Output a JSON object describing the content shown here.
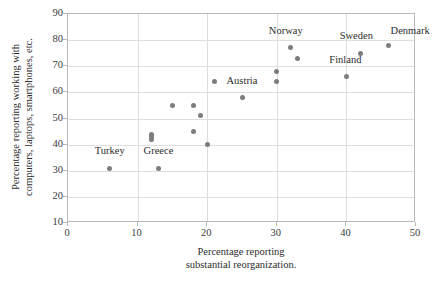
{
  "chart_data": {
    "type": "scatter",
    "title": "",
    "xlabel": "Percentage reporting substantial reorganization.",
    "xlabel_line1": "Percentage reporting",
    "xlabel_line2": "substantial reorganization.",
    "ylabel": "Percentage reporting working with computers, laptops, smartphones, etc.",
    "ylabel_line1": "Percentage reporting working with",
    "ylabel_line2": "computers, laptops, smartphones, etc.",
    "xlim": [
      0,
      50
    ],
    "ylim": [
      10,
      90
    ],
    "xticks": [
      0,
      10,
      20,
      30,
      40,
      50
    ],
    "yticks": [
      10,
      20,
      30,
      40,
      50,
      60,
      70,
      80,
      90
    ],
    "xtick_labels": [
      "0",
      "10",
      "20",
      "30",
      "40",
      "50"
    ],
    "ytick_labels": [
      "10",
      "20",
      "30",
      "40",
      "50",
      "60",
      "70",
      "80",
      "90"
    ],
    "grid": true,
    "legend": false,
    "marker_color": "#7d7d7d",
    "grid_color": "#dedede",
    "axis_color": "#b9b9b9",
    "points": [
      {
        "x": 6,
        "y": 31,
        "label": "Turkey"
      },
      {
        "x": 12,
        "y": 44,
        "label": ""
      },
      {
        "x": 12,
        "y": 43,
        "label": ""
      },
      {
        "x": 12,
        "y": 42,
        "label": ""
      },
      {
        "x": 13,
        "y": 31,
        "label": "Greece"
      },
      {
        "x": 15,
        "y": 55,
        "label": ""
      },
      {
        "x": 18,
        "y": 55,
        "label": ""
      },
      {
        "x": 19,
        "y": 51,
        "label": ""
      },
      {
        "x": 18,
        "y": 45,
        "label": ""
      },
      {
        "x": 20,
        "y": 40,
        "label": ""
      },
      {
        "x": 21,
        "y": 64,
        "label": ""
      },
      {
        "x": 25,
        "y": 58,
        "label": "Austria"
      },
      {
        "x": 30,
        "y": 68,
        "label": ""
      },
      {
        "x": 30,
        "y": 64,
        "label": ""
      },
      {
        "x": 32,
        "y": 77,
        "label": "Norway"
      },
      {
        "x": 33,
        "y": 73,
        "label": ""
      },
      {
        "x": 40,
        "y": 66,
        "label": "Finland"
      },
      {
        "x": 42,
        "y": 75,
        "label": "Sweden"
      },
      {
        "x": 46,
        "y": 78,
        "label": "Denmark"
      }
    ],
    "annotations": [
      {
        "text": "Turkey",
        "x": 6,
        "y": 31,
        "dx": 0,
        "dy": 14
      },
      {
        "text": "Greece",
        "x": 13,
        "y": 31,
        "dx": 0,
        "dy": 14
      },
      {
        "text": "Austria",
        "x": 25,
        "y": 58,
        "dx": 0,
        "dy": 14
      },
      {
        "text": "Norway",
        "x": 32,
        "y": 77,
        "dx": -5,
        "dy": 14
      },
      {
        "text": "Finland",
        "x": 40,
        "y": 66,
        "dx": -1,
        "dy": 14
      },
      {
        "text": "Sweden",
        "x": 42,
        "y": 75,
        "dx": -4,
        "dy": 14
      },
      {
        "text": "Denmark",
        "x": 46,
        "y": 78,
        "dx": 22,
        "dy": 11
      }
    ]
  }
}
